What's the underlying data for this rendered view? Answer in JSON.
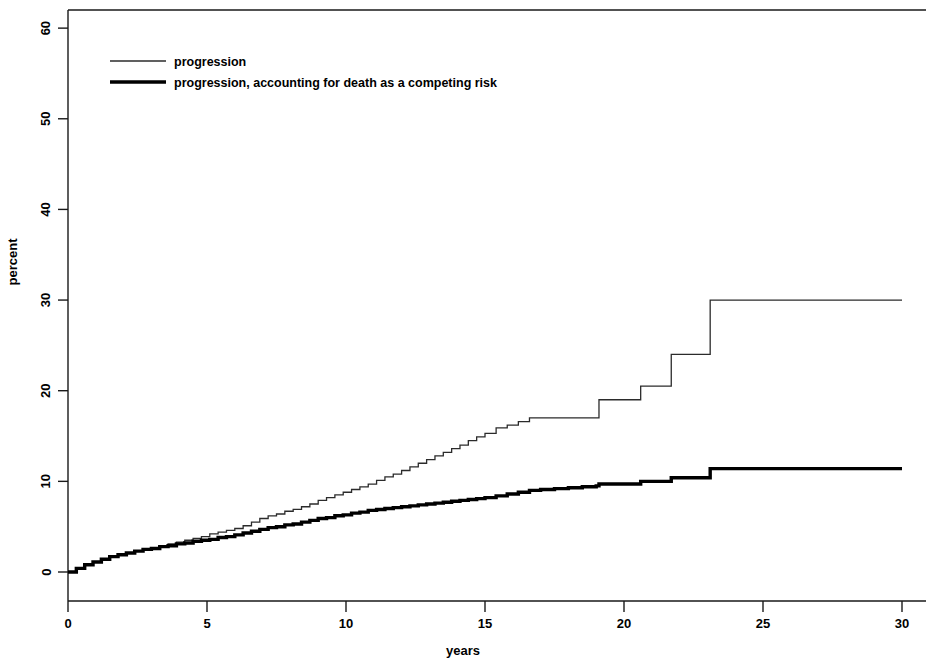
{
  "chart_data": {
    "type": "line",
    "title": "",
    "xlabel": "years",
    "ylabel": "percent",
    "xlim": [
      0,
      30
    ],
    "ylim": [
      0,
      62
    ],
    "xticks": [
      0,
      5,
      10,
      15,
      20,
      25,
      30
    ],
    "yticks": [
      0,
      10,
      20,
      30,
      40,
      50,
      60
    ],
    "xtick_labels": [
      "0",
      "5",
      "10",
      "15",
      "20",
      "25",
      "30"
    ],
    "ytick_labels": [
      "0",
      "10",
      "20",
      "30",
      "40",
      "50",
      "60"
    ],
    "grid": false,
    "legend_position": "top-left",
    "step_type": "post",
    "series": [
      {
        "name": "progression",
        "style": "thin",
        "color": "#2b2b2b",
        "linewidth": 1.3,
        "x": [
          0,
          0.3,
          0.6,
          0.9,
          1.2,
          1.5,
          1.8,
          2.1,
          2.4,
          2.7,
          3.0,
          3.3,
          3.6,
          3.9,
          4.2,
          4.5,
          4.8,
          5.1,
          5.4,
          5.7,
          6.0,
          6.3,
          6.6,
          6.9,
          7.2,
          7.5,
          7.8,
          8.1,
          8.4,
          8.7,
          9.0,
          9.3,
          9.6,
          9.9,
          10.2,
          10.5,
          10.8,
          11.1,
          11.4,
          11.7,
          12.0,
          12.3,
          12.6,
          12.9,
          13.2,
          13.5,
          13.8,
          14.1,
          14.4,
          14.7,
          15.0,
          15.4,
          15.8,
          16.2,
          16.6,
          17.0,
          17.5,
          18.0,
          18.5,
          19.0,
          19.1,
          20.0,
          20.6,
          21.6,
          21.7,
          23.0,
          23.1,
          30.0
        ],
        "y": [
          0.0,
          0.4,
          0.8,
          1.1,
          1.4,
          1.7,
          1.9,
          2.1,
          2.3,
          2.5,
          2.7,
          2.9,
          3.1,
          3.3,
          3.5,
          3.7,
          3.9,
          4.2,
          4.4,
          4.6,
          4.8,
          5.1,
          5.5,
          5.9,
          6.2,
          6.4,
          6.7,
          6.9,
          7.2,
          7.5,
          7.9,
          8.2,
          8.5,
          8.8,
          9.1,
          9.4,
          9.7,
          10.1,
          10.5,
          10.8,
          11.2,
          11.6,
          12.0,
          12.4,
          12.8,
          13.2,
          13.6,
          14.0,
          14.5,
          14.9,
          15.3,
          15.9,
          16.2,
          16.6,
          17.0,
          17.0,
          17.0,
          17.0,
          17.0,
          17.0,
          19.0,
          19.0,
          20.5,
          20.5,
          24.0,
          24.0,
          30.0,
          30.0
        ],
        "final_value": 30.0
      },
      {
        "name": "progression, accounting for death as a competing risk",
        "style": "thick",
        "color": "#000000",
        "linewidth": 3.4,
        "x": [
          0,
          0.3,
          0.6,
          0.9,
          1.2,
          1.5,
          1.8,
          2.1,
          2.4,
          2.7,
          3.0,
          3.3,
          3.6,
          3.9,
          4.2,
          4.5,
          4.8,
          5.1,
          5.4,
          5.7,
          6.0,
          6.3,
          6.6,
          6.9,
          7.2,
          7.5,
          7.8,
          8.1,
          8.4,
          8.7,
          9.0,
          9.3,
          9.6,
          9.9,
          10.2,
          10.5,
          10.8,
          11.1,
          11.4,
          11.7,
          12.0,
          12.3,
          12.6,
          12.9,
          13.2,
          13.5,
          13.8,
          14.1,
          14.4,
          14.7,
          15.0,
          15.4,
          15.8,
          16.2,
          16.6,
          17.0,
          17.5,
          18.0,
          18.5,
          19.0,
          19.1,
          20.0,
          20.6,
          21.6,
          21.7,
          23.0,
          23.1,
          30.0
        ],
        "y": [
          0.0,
          0.4,
          0.8,
          1.1,
          1.4,
          1.7,
          1.9,
          2.1,
          2.3,
          2.5,
          2.6,
          2.8,
          2.9,
          3.1,
          3.2,
          3.4,
          3.5,
          3.6,
          3.8,
          3.9,
          4.1,
          4.3,
          4.5,
          4.7,
          4.9,
          5.0,
          5.2,
          5.3,
          5.5,
          5.7,
          5.9,
          6.0,
          6.2,
          6.3,
          6.5,
          6.6,
          6.8,
          6.9,
          7.0,
          7.1,
          7.2,
          7.3,
          7.4,
          7.5,
          7.6,
          7.7,
          7.8,
          7.9,
          8.0,
          8.1,
          8.2,
          8.4,
          8.6,
          8.8,
          9.0,
          9.1,
          9.2,
          9.3,
          9.4,
          9.5,
          9.7,
          9.7,
          10.0,
          10.0,
          10.4,
          10.4,
          11.4,
          11.4
        ],
        "final_value": 11.4
      }
    ]
  },
  "legend": {
    "entries": [
      {
        "label": "progression",
        "style": "thin"
      },
      {
        "label": "progression, accounting for death as a competing risk",
        "style": "thick"
      }
    ]
  },
  "axis_labels": {
    "x": "years",
    "y": "percent"
  },
  "colors": {
    "background": "#ffffff",
    "axis": "#1a1a1a",
    "series_thin": "#2b2b2b",
    "series_thick": "#000000"
  }
}
